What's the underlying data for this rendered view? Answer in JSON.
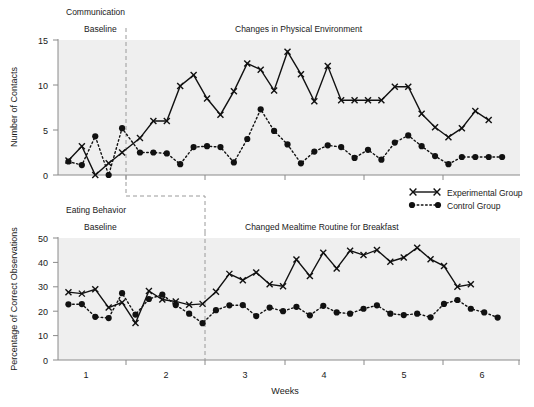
{
  "figure": {
    "width": 534,
    "height": 407,
    "background": "#ffffff",
    "plot_background": "#efefef",
    "ink_color": "#111111",
    "axis_color": "#8a8a8a"
  },
  "legend": {
    "position": "middle-right",
    "entries": [
      {
        "label": "Experimental Group",
        "marker": "x-marker",
        "line": "solid"
      },
      {
        "label": "Control Group",
        "marker": "dot-marker",
        "line": "dotted"
      }
    ]
  },
  "axis": {
    "xlabel": "Weeks",
    "x_tick_labels": [
      "1",
      "2",
      "3",
      "4",
      "5",
      "6"
    ]
  },
  "panels": [
    {
      "id": "communication",
      "behavior_label": "Communication",
      "baseline_label": "Baseline",
      "intervention_label": "Changes in Physical Environment",
      "ylabel": "Number of Contacts",
      "y_tick_labels": [
        "0",
        "5",
        "10",
        "15"
      ]
    },
    {
      "id": "eating-behavior",
      "behavior_label": "Eating Behavior",
      "baseline_label": "Baseline",
      "intervention_label": "Changed Mealtime Routine for Breakfast",
      "ylabel": "Percentage of Correct Observations",
      "y_tick_labels": [
        "0",
        "10",
        "20",
        "30",
        "40",
        "50"
      ]
    }
  ],
  "chart_data": {
    "type": "line",
    "xlabel": "Weeks",
    "grid": false,
    "legend_position": "middle-right",
    "panels": [
      {
        "name": "Communication",
        "ylabel": "Number of Contacts",
        "ylim": [
          0,
          15
        ],
        "yticks": [
          0,
          5,
          10,
          15
        ],
        "xlim": [
          0.5,
          6.7
        ],
        "xticks": [
          1.5,
          2.5,
          3.5,
          4.5,
          5.5
        ],
        "phase_change_x": 1.5,
        "baseline_label": "Baseline",
        "intervention_label": "Changes in Physical Environment",
        "series": [
          {
            "name": "Experimental Group",
            "marker": "x",
            "line": "solid",
            "x": [
              0.64,
              0.82,
              1.0,
              1.18,
              1.36,
              1.6,
              1.78,
              1.96,
              2.14,
              2.32,
              2.5,
              2.68,
              2.86,
              3.04,
              3.22,
              3.4,
              3.58,
              3.76,
              3.94,
              4.12,
              4.3,
              4.48,
              4.66,
              4.84,
              5.02,
              5.2,
              5.38,
              5.56,
              5.74,
              5.92,
              6.1,
              6.28,
              6.46
            ],
            "y": [
              1.6,
              3.2,
              0.0,
              1.3,
              2.5,
              4.1,
              6.0,
              6.0,
              9.9,
              11.1,
              8.5,
              6.7,
              9.3,
              12.4,
              11.7,
              9.4,
              13.7,
              11.2,
              8.2,
              12.1,
              8.3,
              8.3,
              8.3,
              8.3,
              9.8,
              9.8,
              6.8,
              5.3,
              4.2,
              5.2,
              7.1,
              6.1
            ]
          },
          {
            "name": "Control Group",
            "marker": "o",
            "line": "dotted",
            "x": [
              0.64,
              0.82,
              1.0,
              1.18,
              1.36,
              1.6,
              1.78,
              1.96,
              2.14,
              2.32,
              2.5,
              2.68,
              2.86,
              3.04,
              3.22,
              3.4,
              3.58,
              3.76,
              3.94,
              4.12,
              4.3,
              4.48,
              4.66,
              4.84,
              5.02,
              5.2,
              5.38,
              5.56,
              5.74,
              5.92,
              6.1,
              6.28,
              6.46
            ],
            "y": [
              1.5,
              1.1,
              4.3,
              0.0,
              5.2,
              2.5,
              2.5,
              2.4,
              1.2,
              3.1,
              3.2,
              3.1,
              1.4,
              4.0,
              7.3,
              4.9,
              3.4,
              1.3,
              2.6,
              3.3,
              3.1,
              1.9,
              2.8,
              1.7,
              3.6,
              4.4,
              3.2,
              2.1,
              1.2,
              2.0,
              2.0,
              2.0,
              2.0
            ]
          }
        ]
      },
      {
        "name": "Eating Behavior",
        "ylabel": "Percentage of Correct Observations",
        "ylim": [
          0,
          50
        ],
        "yticks": [
          0,
          10,
          20,
          30,
          40,
          50
        ],
        "xlim": [
          0.5,
          6.7
        ],
        "xticks": [
          1.5,
          2.5,
          3.5,
          4.5,
          5.5
        ],
        "phase_change_x": 2.5,
        "baseline_label": "Baseline",
        "intervention_label": "Changed Mealtime Routine for Breakfast",
        "series": [
          {
            "name": "Experimental Group",
            "marker": "x",
            "line": "solid",
            "x": [
              0.64,
              0.82,
              1.0,
              1.18,
              1.36,
              1.54,
              1.72,
              1.9,
              2.08,
              2.26,
              2.44,
              2.62,
              2.8,
              2.98,
              3.16,
              3.34,
              3.52,
              3.7,
              3.88,
              4.06,
              4.24,
              4.42,
              4.6,
              4.78,
              4.96,
              5.14,
              5.32,
              5.5,
              5.68,
              5.86,
              6.04,
              6.22,
              6.4
            ],
            "y": [
              27.8,
              27.2,
              29.0,
              21.5,
              23.6,
              15.2,
              28.3,
              24.8,
              24.0,
              22.6,
              23.0,
              28.0,
              35.3,
              32.7,
              35.9,
              31.0,
              30.2,
              41.2,
              34.4,
              44.0,
              37.5,
              44.8,
              43.0,
              45.1,
              40.3,
              42.0,
              46.0,
              41.3,
              38.5,
              30.0,
              31.0
            ]
          },
          {
            "name": "Control Group",
            "marker": "o",
            "line": "dotted",
            "x": [
              0.64,
              0.82,
              1.0,
              1.18,
              1.36,
              1.54,
              1.72,
              1.9,
              2.08,
              2.26,
              2.44,
              2.62,
              2.8,
              2.98,
              3.16,
              3.34,
              3.52,
              3.7,
              3.88,
              4.06,
              4.24,
              4.42,
              4.6,
              4.78,
              4.96,
              5.14,
              5.32,
              5.5,
              5.68,
              5.86,
              6.04,
              6.22,
              6.4
            ],
            "y": [
              22.8,
              22.9,
              17.7,
              17.2,
              27.4,
              18.6,
              25.0,
              26.8,
              22.5,
              19.0,
              15.1,
              20.4,
              22.4,
              22.5,
              18.0,
              21.5,
              20.0,
              21.8,
              18.3,
              22.2,
              19.5,
              19.0,
              21.0,
              22.4,
              19.0,
              18.4,
              19.0,
              17.5,
              23.0,
              24.6,
              21.0,
              19.5,
              17.4
            ]
          }
        ]
      }
    ]
  }
}
